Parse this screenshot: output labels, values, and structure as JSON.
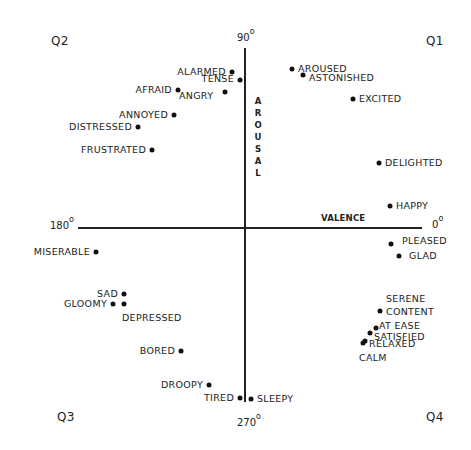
{
  "diagram": {
    "quadrants": {
      "q1": "Q1",
      "q2": "Q2",
      "q3": "Q3",
      "q4": "Q4"
    },
    "angles": {
      "top": "90",
      "left": "180",
      "right": "0",
      "bottom": "270",
      "degree_symbol": "o"
    },
    "axes": {
      "horizontal_label": "VALENCE",
      "vertical_label": "AROUSAL"
    },
    "colors": {
      "ink": "#222222",
      "background": "#ffffff"
    },
    "emotions": [
      {
        "label": "ALARMED",
        "x": 232,
        "y": 72,
        "label_side": "left"
      },
      {
        "label": "TENSE",
        "x": 240,
        "y": 80,
        "label_side": "left"
      },
      {
        "label": "AFRAID",
        "x": 178,
        "y": 90,
        "label_side": "left"
      },
      {
        "label": "ANGRY",
        "x": 225,
        "y": 92,
        "label_side": "left"
      },
      {
        "label": "ANNOYED",
        "x": 174,
        "y": 115,
        "label_side": "left"
      },
      {
        "label": "DISTRESSED",
        "x": 138,
        "y": 127,
        "label_side": "left"
      },
      {
        "label": "FRUSTRATED",
        "x": 152,
        "y": 150,
        "label_side": "left"
      },
      {
        "label": "AROUSED",
        "x": 292,
        "y": 69,
        "label_side": "right"
      },
      {
        "label": "ASTONISHED",
        "x": 303,
        "y": 75,
        "label_side": "right"
      },
      {
        "label": "EXCITED",
        "x": 353,
        "y": 99,
        "label_side": "right"
      },
      {
        "label": "DELIGHTED",
        "x": 379,
        "y": 163,
        "label_side": "right"
      },
      {
        "label": "HAPPY",
        "x": 390,
        "y": 206,
        "label_side": "right"
      },
      {
        "label": "PLEASED",
        "x": 391,
        "y": 244,
        "label_side": "right"
      },
      {
        "label": "GLAD",
        "x": 399,
        "y": 256,
        "label_side": "right"
      },
      {
        "label": "MISERABLE",
        "x": 96,
        "y": 252,
        "label_side": "left"
      },
      {
        "label": "SAD",
        "x": 124,
        "y": 294,
        "label_side": "left"
      },
      {
        "label": "GLOOMY",
        "x": 113,
        "y": 304,
        "label_side": "left"
      },
      {
        "label": "DEPRESSED",
        "x": 124,
        "y": 304,
        "label_side": "below"
      },
      {
        "label": "BORED",
        "x": 181,
        "y": 351,
        "label_side": "left"
      },
      {
        "label": "DROOPY",
        "x": 209,
        "y": 385,
        "label_side": "left"
      },
      {
        "label": "TIRED",
        "x": 240,
        "y": 398,
        "label_side": "left"
      },
      {
        "label": "SLEEPY",
        "x": 251,
        "y": 399,
        "label_side": "right"
      },
      {
        "label": "SERENE",
        "x": 380,
        "y": 311,
        "label_side": "above-right"
      },
      {
        "label": "CONTENT",
        "x": 380,
        "y": 311,
        "label_side": "right"
      },
      {
        "label": "AT EASE",
        "x": 376,
        "y": 328,
        "label_side": "right"
      },
      {
        "label": "SATISFIED",
        "x": 370,
        "y": 333,
        "label_side": "right"
      },
      {
        "label": "RELAXED",
        "x": 365,
        "y": 341,
        "label_side": "right"
      },
      {
        "label": "CALM",
        "x": 363,
        "y": 343,
        "label_side": "below"
      }
    ]
  }
}
